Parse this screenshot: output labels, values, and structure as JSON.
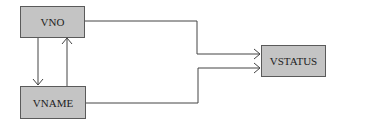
{
  "diagram": {
    "type": "dependency-diagram",
    "nodes": [
      {
        "id": "vno",
        "label": "VNO"
      },
      {
        "id": "vname",
        "label": "VNAME"
      },
      {
        "id": "vstatus",
        "label": "VSTATUS"
      }
    ],
    "edges": [
      {
        "from": "vno",
        "to": "vname"
      },
      {
        "from": "vname",
        "to": "vno"
      },
      {
        "from": "vno",
        "to": "vstatus"
      },
      {
        "from": "vname",
        "to": "vstatus"
      }
    ],
    "colors": {
      "node_fill": "#c4c4c4",
      "node_border": "#5a5a5a",
      "line": "#444444"
    }
  }
}
